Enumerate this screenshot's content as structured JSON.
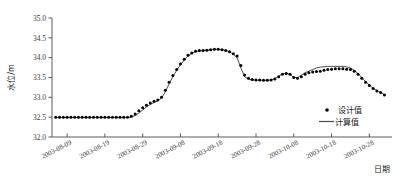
{
  "chart_data": {
    "type": "line",
    "title": "",
    "xlabel": "日期",
    "ylabel": "水位/m",
    "ylim": [
      32.0,
      35.0
    ],
    "ytick_labels": [
      "32.0",
      "32.5",
      "33.0",
      "33.5",
      "34.0",
      "34.5",
      "35.0"
    ],
    "ytick_values": [
      32.0,
      32.5,
      33.0,
      33.5,
      34.0,
      34.5,
      35.0
    ],
    "xtick_labels": [
      "2003-08-09",
      "2003-08-19",
      "2003-08-29",
      "2003-09-08",
      "2003-09-18",
      "2003-09-28",
      "2003-10-08",
      "2003-10-18",
      "2003-10-28"
    ],
    "xtick_values": [
      0,
      10,
      20,
      30,
      40,
      50,
      60,
      70,
      80
    ],
    "xlim": [
      -4,
      86
    ],
    "grid": false,
    "legend_position": "bottom-right",
    "series": [
      {
        "name": "设计值",
        "style": "points",
        "marker": "dot",
        "color": "#000000",
        "x": [
          -3,
          -2,
          -1,
          0,
          1,
          2,
          3,
          4,
          5,
          6,
          7,
          8,
          9,
          10,
          11,
          12,
          13,
          14,
          15,
          16,
          17,
          18,
          19,
          20,
          21,
          22,
          23,
          24,
          25,
          26,
          27,
          28,
          29,
          30,
          31,
          32,
          33,
          34,
          35,
          36,
          37,
          38,
          39,
          40,
          41,
          42,
          43,
          44,
          45,
          46,
          47,
          48,
          49,
          50,
          51,
          52,
          53,
          54,
          55,
          56,
          57,
          58,
          59,
          60,
          61,
          62,
          63,
          64,
          65,
          66,
          67,
          68,
          69,
          70,
          71,
          72,
          73,
          74,
          75,
          76,
          77,
          78,
          79,
          80,
          81,
          82,
          83,
          84
        ],
        "values": [
          32.5,
          32.5,
          32.5,
          32.5,
          32.5,
          32.5,
          32.5,
          32.5,
          32.5,
          32.5,
          32.5,
          32.5,
          32.5,
          32.5,
          32.5,
          32.5,
          32.5,
          32.5,
          32.5,
          32.5,
          32.52,
          32.58,
          32.66,
          32.74,
          32.8,
          32.86,
          32.9,
          32.93,
          33.0,
          33.18,
          33.38,
          33.55,
          33.7,
          33.84,
          33.96,
          34.06,
          34.12,
          34.16,
          34.18,
          34.18,
          34.19,
          34.2,
          34.21,
          34.21,
          34.2,
          34.18,
          34.15,
          34.1,
          34.04,
          33.8,
          33.56,
          33.48,
          33.45,
          33.44,
          33.44,
          33.43,
          33.43,
          33.44,
          33.46,
          33.52,
          33.58,
          33.6,
          33.58,
          33.5,
          33.48,
          33.52,
          33.58,
          33.62,
          33.64,
          33.65,
          33.66,
          33.68,
          33.7,
          33.71,
          33.72,
          33.72,
          33.72,
          33.71,
          33.7,
          33.66,
          33.58,
          33.48,
          33.38,
          33.3,
          33.22,
          33.16,
          33.12,
          33.06
        ]
      },
      {
        "name": "计算值",
        "style": "line",
        "color": "#4d4d4d",
        "x": [
          -3,
          -2,
          -1,
          0,
          1,
          2,
          3,
          4,
          5,
          6,
          7,
          8,
          9,
          10,
          11,
          12,
          13,
          14,
          15,
          16,
          17,
          18,
          19,
          20,
          21,
          22,
          23,
          24,
          25,
          26,
          27,
          28,
          29,
          30,
          31,
          32,
          33,
          34,
          35,
          36,
          37,
          38,
          39,
          40,
          41,
          42,
          43,
          44,
          45,
          46,
          47,
          48,
          49,
          50,
          51,
          52,
          53,
          54,
          55,
          56,
          57,
          58,
          59,
          60,
          61,
          62,
          63,
          64,
          65,
          66,
          67,
          68,
          69,
          70,
          71,
          72,
          73,
          74,
          75,
          76,
          77,
          78,
          79,
          80,
          81,
          82,
          83,
          84
        ],
        "values": [
          32.49,
          32.49,
          32.49,
          32.49,
          32.49,
          32.49,
          32.49,
          32.49,
          32.49,
          32.49,
          32.49,
          32.49,
          32.49,
          32.49,
          32.49,
          32.49,
          32.49,
          32.49,
          32.49,
          32.49,
          32.5,
          32.54,
          32.6,
          32.68,
          32.76,
          32.82,
          32.87,
          32.91,
          32.98,
          33.14,
          33.34,
          33.52,
          33.68,
          33.82,
          33.94,
          34.04,
          34.11,
          34.15,
          34.17,
          34.18,
          34.19,
          34.2,
          34.21,
          34.21,
          34.2,
          34.18,
          34.15,
          34.09,
          34.0,
          33.74,
          33.52,
          33.46,
          33.44,
          33.43,
          33.43,
          33.43,
          33.43,
          33.44,
          33.47,
          33.53,
          33.59,
          33.61,
          33.58,
          33.5,
          33.5,
          33.56,
          33.62,
          33.66,
          33.7,
          33.74,
          33.76,
          33.77,
          33.78,
          33.78,
          33.78,
          33.78,
          33.78,
          33.77,
          33.74,
          33.68,
          33.6,
          33.5,
          33.4,
          33.31,
          33.23,
          33.17,
          33.12,
          33.07
        ]
      }
    ],
    "legend": [
      {
        "label": "设计值",
        "marker": "dot"
      },
      {
        "label": "计算值",
        "marker": "line"
      }
    ]
  }
}
